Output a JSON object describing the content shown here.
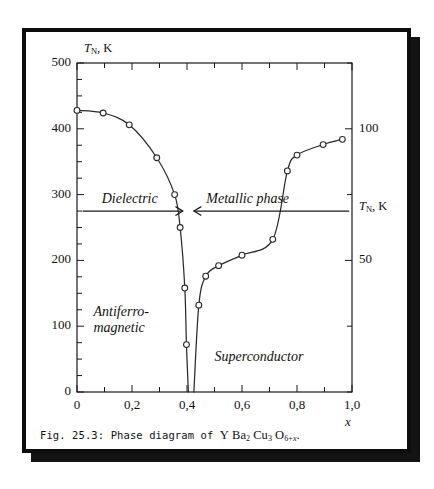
{
  "figure": {
    "caption_prefix": "Fig. 25.3: Phase diagram of",
    "caption_formula_parts": {
      "y": "Y",
      "ba": "Ba",
      "ba_sub": "2",
      "cu": "Cu",
      "cu_sub": "3",
      "o": "O",
      "o_sub_pre": "6+",
      "o_sub_var": "x",
      "period": "."
    },
    "frame_color": "#0d0d0d",
    "shadow_color": "#131313",
    "background": "#ffffff"
  },
  "chart_data": {
    "type": "line",
    "title": "",
    "xlabel": "x",
    "ylabel": "T_N, K",
    "ylabel_left_symbol": "T",
    "ylabel_left_sub": "N",
    "ylabel_left_unit": ", K",
    "ylabel_right_symbol": "T",
    "ylabel_right_sub": "N",
    "ylabel_right_unit": ", K",
    "xlim": [
      0,
      1.0
    ],
    "ylim": [
      0,
      500
    ],
    "ylim_right": [
      0,
      125
    ],
    "grid": false,
    "legend": "none",
    "decimal_separator": ",",
    "xticks": [
      0,
      0.2,
      0.4,
      0.6,
      0.8,
      1.0
    ],
    "xtick_labels": [
      "0",
      "0,2",
      "0,4",
      "0,6",
      "0,8",
      "1,0"
    ],
    "xtick_minor_step": 0.1,
    "yticks_left": [
      0,
      100,
      200,
      300,
      400,
      500
    ],
    "ytick_labels_left": [
      "0",
      "100",
      "200",
      "300",
      "400",
      "500"
    ],
    "ytick_minor_step": 25,
    "yticks_right": [
      50,
      100
    ],
    "ytick_labels_right": [
      "50",
      "100"
    ],
    "series": [
      {
        "name": "Antiferromagnetic (Neel) phase boundary",
        "axis": "left",
        "marker": "open-circle",
        "points": [
          {
            "x": 0.0,
            "y": 428
          },
          {
            "x": 0.095,
            "y": 424
          },
          {
            "x": 0.19,
            "y": 406
          },
          {
            "x": 0.29,
            "y": 356
          },
          {
            "x": 0.355,
            "y": 300
          },
          {
            "x": 0.375,
            "y": 250
          },
          {
            "x": 0.392,
            "y": 158
          },
          {
            "x": 0.398,
            "y": 72
          },
          {
            "x": 0.405,
            "y": 0
          }
        ]
      },
      {
        "name": "Superconducting transition (Tc) dome",
        "axis": "right",
        "marker": "open-circle",
        "points": [
          {
            "x": 0.425,
            "y": 0
          },
          {
            "x": 0.443,
            "y": 33
          },
          {
            "x": 0.468,
            "y": 44
          },
          {
            "x": 0.515,
            "y": 48
          },
          {
            "x": 0.6,
            "y": 52
          },
          {
            "x": 0.712,
            "y": 58
          },
          {
            "x": 0.765,
            "y": 84
          },
          {
            "x": 0.8,
            "y": 90
          },
          {
            "x": 0.895,
            "y": 94
          },
          {
            "x": 0.965,
            "y": 96
          }
        ]
      }
    ],
    "annotations": [
      {
        "name": "dielectric-region-label",
        "text": "Dielectric",
        "x": 0.09,
        "y": 290,
        "style": "italic"
      },
      {
        "name": "metallic-phase-label",
        "text": "Metallic phase",
        "x": 0.47,
        "y": 290,
        "style": "italic"
      },
      {
        "name": "antiferromagnetic-region-label",
        "text_line1": "Antiferro-",
        "text_line2": "magnetic",
        "x": 0.06,
        "y": 118,
        "style": "italic"
      },
      {
        "name": "superconductor-region-label",
        "text": "Superconductor",
        "x": 0.5,
        "y": 50,
        "style": "italic"
      },
      {
        "name": "dielectric-arrow",
        "kind": "arrow-right",
        "from_x": 0.02,
        "to_x": 0.385,
        "y": 275
      },
      {
        "name": "metallic-arrow",
        "kind": "arrow-left",
        "from_x": 0.99,
        "to_x": 0.425,
        "y": 275
      }
    ]
  }
}
